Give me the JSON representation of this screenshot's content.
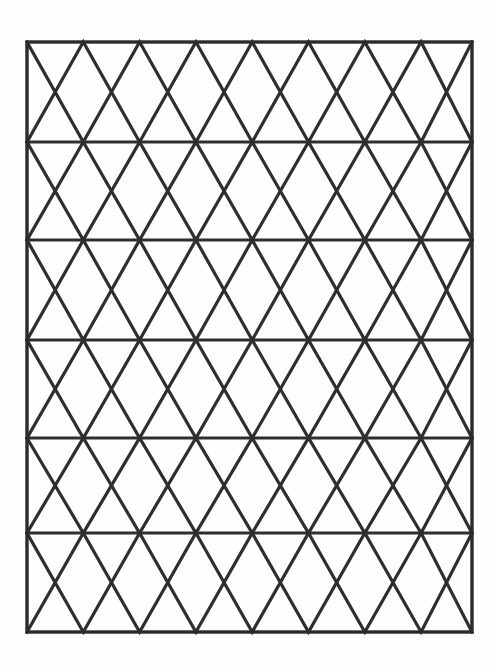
{
  "figure": {
    "background_color": "#fefefe",
    "canvas": {
      "width": 493,
      "height": 667
    }
  },
  "style": {
    "line_color": "#2e2e2e",
    "border_color": "#2b2b2b",
    "border_stroke_width": 3.4,
    "horizontal_stroke_width": 3.0,
    "diagonal_stroke_width": 3.2
  },
  "geometry": {
    "frame": {
      "left": 27,
      "top": 42,
      "right": 472,
      "bottom": 632
    },
    "horizontal_rules_y": [
      142,
      240,
      340,
      438,
      533
    ],
    "band_boundaries_y": [
      42,
      142,
      240,
      340,
      438,
      533,
      632
    ],
    "band_count": 6,
    "zigzag_half_period": 56.3,
    "columns_x": [
      27,
      83.3,
      139.6,
      195.9,
      252.2,
      308.5,
      364.8,
      421.1,
      472
    ],
    "band_phase": [
      "top",
      "bottom",
      "top",
      "bottom",
      "top",
      "bottom"
    ]
  },
  "chart_data": {
    "type": "diagram",
    "frame": {
      "x0": 27,
      "y0": 42,
      "x1": 472,
      "y1": 632
    },
    "horizontal_lines": [
      {
        "y": 142,
        "x0": 27,
        "x1": 472
      },
      {
        "y": 240,
        "x0": 27,
        "x1": 472
      },
      {
        "y": 340,
        "x0": 27,
        "x1": 472
      },
      {
        "y": 438,
        "x0": 27,
        "x1": 472
      },
      {
        "y": 533,
        "x0": 27,
        "x1": 472
      }
    ],
    "bands": [
      {
        "index": 0,
        "y_top": 42,
        "y_bottom": 142,
        "apex_row": "top",
        "apex_x": [
          27,
          139.6,
          252.2,
          364.8,
          472
        ],
        "base_x": [
          83.3,
          195.9,
          308.5,
          421.1
        ]
      },
      {
        "index": 1,
        "y_top": 142,
        "y_bottom": 240,
        "apex_row": "bottom",
        "apex_x": [
          27,
          139.6,
          252.2,
          364.8,
          472
        ],
        "base_x": [
          83.3,
          195.9,
          308.5,
          421.1
        ]
      },
      {
        "index": 2,
        "y_top": 240,
        "y_bottom": 340,
        "apex_row": "top",
        "apex_x": [
          27,
          139.6,
          252.2,
          364.8,
          472
        ],
        "base_x": [
          83.3,
          195.9,
          308.5,
          421.1
        ]
      },
      {
        "index": 3,
        "y_top": 340,
        "y_bottom": 438,
        "apex_row": "bottom",
        "apex_x": [
          27,
          139.6,
          252.2,
          364.8,
          472
        ],
        "base_x": [
          83.3,
          195.9,
          308.5,
          421.1
        ]
      },
      {
        "index": 4,
        "y_top": 438,
        "y_bottom": 533,
        "apex_row": "top",
        "apex_x": [
          27,
          139.6,
          252.2,
          364.8,
          472
        ],
        "base_x": [
          83.3,
          195.9,
          308.5,
          421.1
        ]
      },
      {
        "index": 5,
        "y_top": 533,
        "y_bottom": 632,
        "apex_row": "bottom",
        "apex_x": [
          27,
          139.6,
          252.2,
          364.8,
          472
        ],
        "base_x": [
          83.3,
          195.9,
          308.5,
          421.1
        ]
      }
    ],
    "xlabel": "",
    "ylabel": "",
    "legend": [],
    "annotations": []
  }
}
